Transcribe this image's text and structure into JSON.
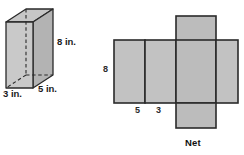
{
  "figure": {
    "title_caption": "Net",
    "prism": {
      "name": "rectangular-prism",
      "labels": {
        "height": "8 in.",
        "depth": "5 in.",
        "width": "3 in."
      },
      "dimensions": {
        "width": 3,
        "depth": 5,
        "height": 8,
        "unit": "in."
      }
    },
    "net": {
      "name": "prism-net",
      "caption": "Net",
      "labels": {
        "height": "8",
        "panel_a": "5",
        "panel_b": "3"
      },
      "panel_widths": [
        5,
        3,
        5,
        3
      ],
      "panel_height": 8,
      "flap_label_top": "",
      "flap_label_bottom": ""
    },
    "colors": {
      "face_light": "#c9c9c9",
      "face_mid": "#bcbcbc",
      "face_dark": "#aeaeae",
      "face_top": "#c4c4c4",
      "outline": "#2a2a2a",
      "background": "#ffffff",
      "text": "#1a1a1a"
    }
  }
}
